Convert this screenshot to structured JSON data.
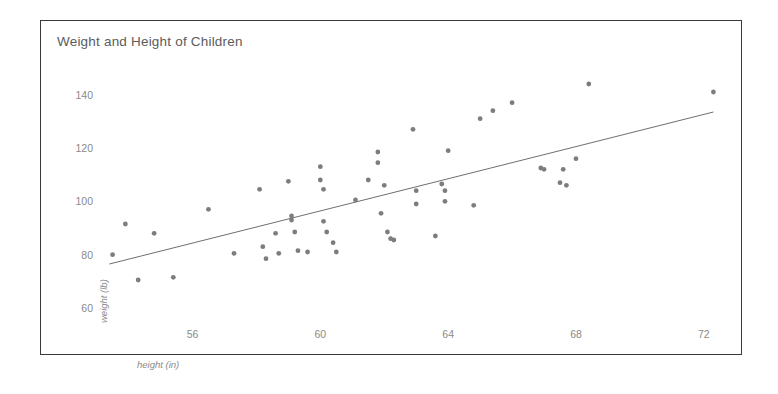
{
  "chart_data": {
    "type": "scatter",
    "title": "Weight and Height of Children",
    "xlabel": "height (in)",
    "ylabel": "weight (lb)",
    "xlim": [
      53.2,
      72.6
    ],
    "ylim": [
      57,
      147
    ],
    "xticks": [
      56,
      60,
      64,
      68,
      72
    ],
    "yticks": [
      60,
      80,
      100,
      120,
      140
    ],
    "grid": false,
    "legend": null,
    "point_color": "#7d7d7d",
    "line_color": "#6e6e6e",
    "trendline": {
      "label": "linear fit",
      "x": [
        53.4,
        72.3
      ],
      "y": [
        76.5,
        133.5
      ]
    },
    "points": [
      {
        "x": 53.5,
        "y": 80.0
      },
      {
        "x": 53.9,
        "y": 91.5
      },
      {
        "x": 54.3,
        "y": 70.5
      },
      {
        "x": 54.8,
        "y": 88.0
      },
      {
        "x": 55.4,
        "y": 71.5
      },
      {
        "x": 56.5,
        "y": 97.0
      },
      {
        "x": 57.3,
        "y": 80.5
      },
      {
        "x": 58.1,
        "y": 104.5
      },
      {
        "x": 58.2,
        "y": 83.0
      },
      {
        "x": 58.3,
        "y": 78.5
      },
      {
        "x": 58.6,
        "y": 88.0
      },
      {
        "x": 58.7,
        "y": 80.5
      },
      {
        "x": 59.0,
        "y": 107.5
      },
      {
        "x": 59.1,
        "y": 94.5
      },
      {
        "x": 59.1,
        "y": 93.0
      },
      {
        "x": 59.2,
        "y": 88.5
      },
      {
        "x": 59.3,
        "y": 81.5
      },
      {
        "x": 59.6,
        "y": 81.0
      },
      {
        "x": 60.0,
        "y": 113.0
      },
      {
        "x": 60.0,
        "y": 108.0
      },
      {
        "x": 60.1,
        "y": 104.5
      },
      {
        "x": 60.1,
        "y": 92.5
      },
      {
        "x": 60.2,
        "y": 88.5
      },
      {
        "x": 60.4,
        "y": 84.5
      },
      {
        "x": 60.5,
        "y": 81.0
      },
      {
        "x": 61.1,
        "y": 100.5
      },
      {
        "x": 61.5,
        "y": 108.0
      },
      {
        "x": 61.8,
        "y": 118.5
      },
      {
        "x": 61.8,
        "y": 114.5
      },
      {
        "x": 61.9,
        "y": 95.5
      },
      {
        "x": 62.0,
        "y": 106.0
      },
      {
        "x": 62.1,
        "y": 88.5
      },
      {
        "x": 62.2,
        "y": 86.0
      },
      {
        "x": 62.3,
        "y": 85.5
      },
      {
        "x": 62.9,
        "y": 127.0
      },
      {
        "x": 63.0,
        "y": 104.0
      },
      {
        "x": 63.0,
        "y": 99.0
      },
      {
        "x": 63.6,
        "y": 87.0
      },
      {
        "x": 63.8,
        "y": 106.5
      },
      {
        "x": 63.9,
        "y": 104.0
      },
      {
        "x": 63.9,
        "y": 100.0
      },
      {
        "x": 64.0,
        "y": 119.0
      },
      {
        "x": 64.8,
        "y": 98.5
      },
      {
        "x": 65.0,
        "y": 131.0
      },
      {
        "x": 65.4,
        "y": 134.0
      },
      {
        "x": 66.0,
        "y": 137.0
      },
      {
        "x": 66.9,
        "y": 112.5
      },
      {
        "x": 67.0,
        "y": 112.0
      },
      {
        "x": 67.5,
        "y": 107.0
      },
      {
        "x": 67.6,
        "y": 112.0
      },
      {
        "x": 67.7,
        "y": 106.0
      },
      {
        "x": 68.0,
        "y": 116.0
      },
      {
        "x": 68.4,
        "y": 144.0
      },
      {
        "x": 72.3,
        "y": 141.0
      }
    ]
  }
}
